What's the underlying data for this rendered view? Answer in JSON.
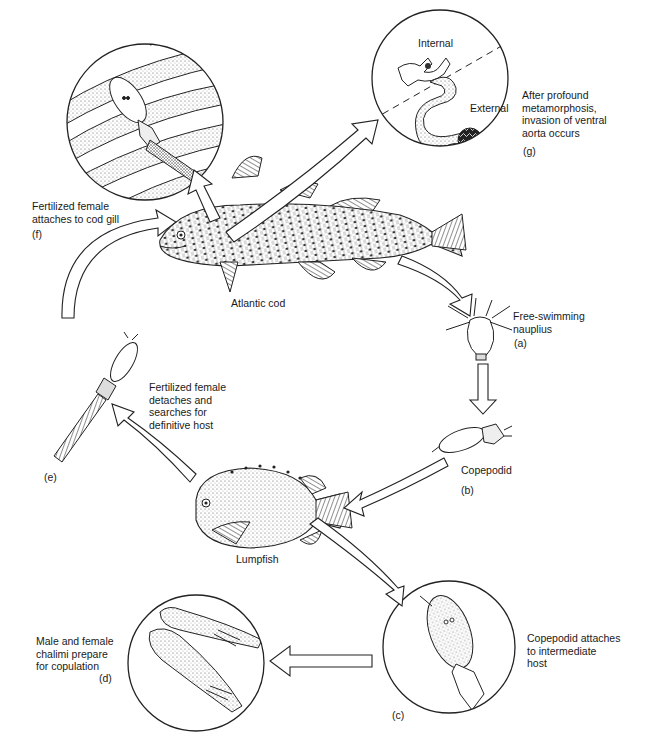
{
  "diagram": {
    "type": "parasite life cycle",
    "hosts": {
      "definitive": "Atlantic cod",
      "intermediate": "Lumpfish"
    },
    "stages": [
      {
        "id": "a",
        "tag": "(a)",
        "label": "Free-swimming\nnauplius"
      },
      {
        "id": "b",
        "tag": "(b)",
        "label": "Copepodid"
      },
      {
        "id": "c",
        "tag": "(c)",
        "label": "Copepodid attaches\nto intermediate\nhost"
      },
      {
        "id": "d",
        "tag": "(d)",
        "label": "Male and female\nchalimi prepare\nfor copulation"
      },
      {
        "id": "e",
        "tag": "(e)",
        "label": "Fertilized female\ndetaches and\nsearches for\ndefinitive host"
      },
      {
        "id": "f",
        "tag": "(f)",
        "label": "Fertilized female\nattaches to cod gill"
      },
      {
        "id": "g",
        "tag": "(g)",
        "label": "After profound\nmetamorphosis,\ninvasion of ventral\naorta occurs"
      }
    ],
    "inset_g": {
      "internal": "Internal",
      "external": "External"
    },
    "colors": {
      "line": "#1a1a1a",
      "background": "#ffffff",
      "stipple": "#6a6a6a"
    }
  }
}
